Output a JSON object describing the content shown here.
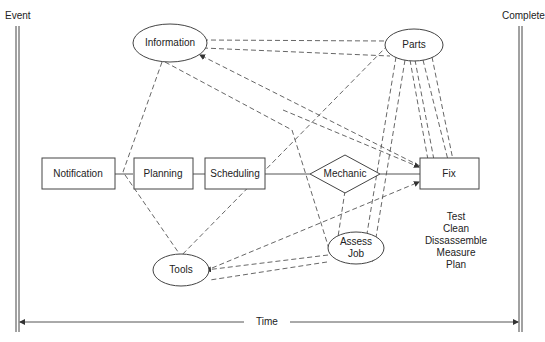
{
  "diagram": {
    "left_boundary_label": "Event",
    "right_boundary_label": "Complete",
    "time_axis_label": "Time",
    "process_boxes": [
      {
        "id": "notification",
        "label": "Notification"
      },
      {
        "id": "planning",
        "label": "Planning"
      },
      {
        "id": "scheduling",
        "label": "Scheduling"
      },
      {
        "id": "fix",
        "label": "Fix"
      }
    ],
    "decision": {
      "id": "mechanic",
      "label": "Mechanic"
    },
    "resources": [
      {
        "id": "information",
        "label": "Information"
      },
      {
        "id": "parts",
        "label": "Parts"
      },
      {
        "id": "tools",
        "label": "Tools"
      },
      {
        "id": "assess_job",
        "label_line1": "Assess",
        "label_line2": "Job"
      }
    ],
    "activities": [
      "Test",
      "Clean",
      "Dissassemble",
      "Measure",
      "Plan"
    ],
    "colors": {
      "line": "#555555",
      "text": "#222222",
      "background": "#ffffff"
    }
  }
}
